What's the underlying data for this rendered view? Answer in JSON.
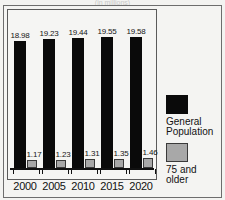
{
  "figure": {
    "title_remnant": "(in millions)",
    "background_color": "#f3f3f1",
    "frame_color": "#6d6d6d"
  },
  "chart_data": {
    "type": "bar",
    "title": "",
    "subtitle": "",
    "xlabel": "",
    "ylabel": "",
    "categories": [
      "2000",
      "2005",
      "2010",
      "2015",
      "2020"
    ],
    "series": [
      {
        "name": "General Population",
        "color": "#0a0a0a",
        "values": [
          18.98,
          19.23,
          19.44,
          19.55,
          19.58
        ],
        "labels": [
          "18.98",
          "19.23",
          "19.44",
          "19.55",
          "19.58"
        ]
      },
      {
        "name": "75 and older",
        "color": "#a8a8a8",
        "values": [
          1.17,
          1.23,
          1.31,
          1.35,
          1.46
        ],
        "labels": [
          "1.17",
          "1.23",
          "1.31",
          "1.35",
          "1.46"
        ]
      }
    ],
    "ylim": [
      0,
      21.5
    ],
    "grid": false,
    "legend_position": "right",
    "axis_ticks_visible": true
  },
  "legend": {
    "entries": [
      {
        "swatch": "black-swatch",
        "line1": "General",
        "line2": "Population"
      },
      {
        "swatch": "gray-swatch",
        "line1": "75 and",
        "line2": "older"
      }
    ]
  }
}
